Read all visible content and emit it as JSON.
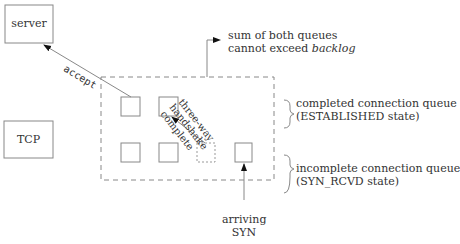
{
  "nodes": {
    "server": "server",
    "tcp": "TCP"
  },
  "edges": {
    "accept": "accept",
    "handshake": [
      "three-way",
      "handshake",
      "complete"
    ],
    "arriving": [
      "arriving",
      "SYN"
    ]
  },
  "annotations": {
    "backlog_line1": "sum of both queues",
    "backlog_line2_prefix": "cannot exceed ",
    "backlog_line2_italic": "backlog",
    "completed_line1": "completed connection queue",
    "completed_line2": "(ESTABLISHED state)",
    "incomplete_line1": "incomplete connection queue",
    "incomplete_line2": "(SYN_RCVD state)"
  }
}
